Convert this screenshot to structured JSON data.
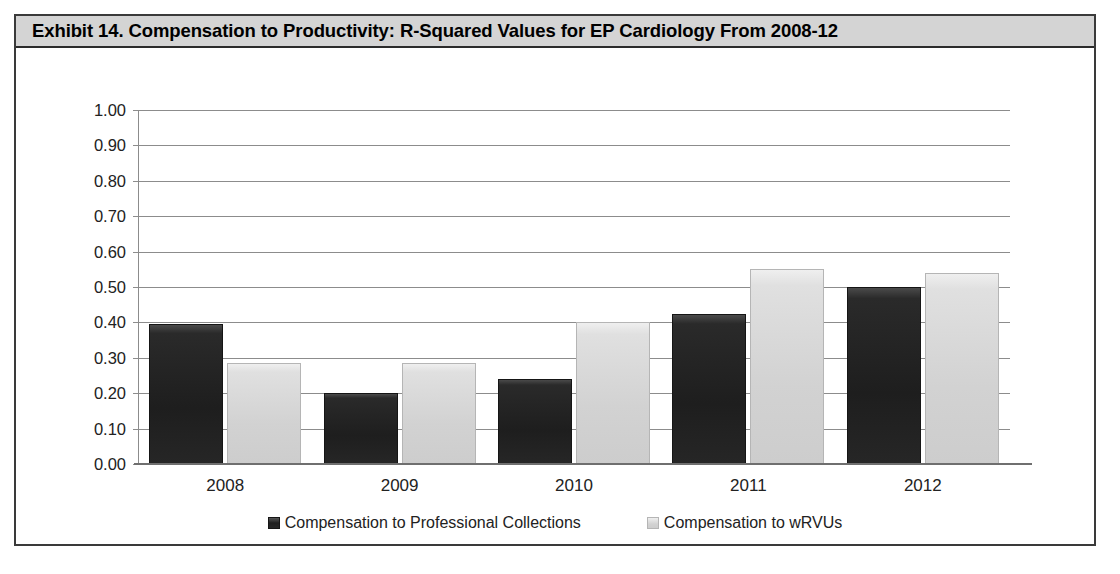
{
  "exhibit": {
    "title": "Exhibit 14. Compensation to Productivity: R-Squared Values for EP Cardiology From 2008-12",
    "banner_color": "#d4d4d4",
    "border_color": "#3a3a3a"
  },
  "chart_data": {
    "type": "bar",
    "title": "Exhibit 14. Compensation to Productivity: R-Squared Values for EP Cardiology From 2008-12",
    "xlabel": "",
    "ylabel": "",
    "categories": [
      "2008",
      "2009",
      "2010",
      "2011",
      "2012"
    ],
    "series": [
      {
        "name": "Compensation to Professional Collections",
        "color": "#1e1e1e",
        "values": [
          0.395,
          0.2,
          0.24,
          0.425,
          0.5
        ]
      },
      {
        "name": "Compensation to wRVUs",
        "color": "#d2d2d2",
        "values": [
          0.285,
          0.285,
          0.4,
          0.55,
          0.54
        ]
      }
    ],
    "ylim": [
      0.0,
      1.0
    ],
    "ytick_labels": [
      "1.00",
      "0.90",
      "0.80",
      "0.70",
      "0.60",
      "0.50",
      "0.40",
      "0.30",
      "0.20",
      "0.10",
      "0.00"
    ],
    "ytick_values": [
      1.0,
      0.9,
      0.8,
      0.7,
      0.6,
      0.5,
      0.4,
      0.3,
      0.2,
      0.1,
      0.0
    ],
    "grid": true,
    "legend_position": "bottom"
  },
  "legend": {
    "entries": [
      {
        "label": "Compensation to Professional Collections",
        "swatch": "dark"
      },
      {
        "label": "Compensation to wRVUs",
        "swatch": "light"
      }
    ]
  }
}
